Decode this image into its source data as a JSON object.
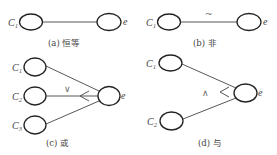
{
  "panels": [
    {
      "id": "a",
      "caption": "(a) 恒等",
      "operator": "",
      "inputs": [
        {
          "name": "C",
          "sub": "1"
        }
      ],
      "output": "e"
    },
    {
      "id": "b",
      "caption": "(b) 非",
      "operator": "~",
      "inputs": [
        {
          "name": "C",
          "sub": "1"
        }
      ],
      "output": "e"
    },
    {
      "id": "c",
      "caption": "(c) 或",
      "operator": "∨",
      "inputs": [
        {
          "name": "C",
          "sub": "1"
        },
        {
          "name": "C",
          "sub": "2"
        },
        {
          "name": "C",
          "sub": "3"
        }
      ],
      "output": "e"
    },
    {
      "id": "d",
      "caption": "(d) 与",
      "operator": "∧",
      "inputs": [
        {
          "name": "C",
          "sub": "1"
        },
        {
          "name": "C",
          "sub": "2"
        }
      ],
      "output": "e"
    }
  ]
}
